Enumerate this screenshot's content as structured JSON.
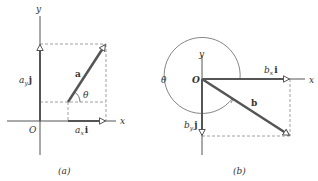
{
  "figure": {
    "panel_a": {
      "caption": "(a)",
      "x_axis_label": "x",
      "y_axis_label": "y",
      "origin_label": "O",
      "vector_label": "a",
      "angle_label": "θ",
      "x_component": {
        "coef": "a",
        "sub": "x",
        "unit": "i"
      },
      "y_component": {
        "coef": "a",
        "sub": "y",
        "unit": "j"
      }
    },
    "panel_b": {
      "caption": "(b)",
      "x_axis_label": "x",
      "y_axis_label": "y",
      "origin_label": "O",
      "vector_label": "b",
      "angle_label": "θ",
      "x_component": {
        "coef": "b",
        "sub": "x",
        "unit": "i"
      },
      "y_component": {
        "coef": "b",
        "sub": "y",
        "unit": "j"
      }
    },
    "colors": {
      "axis": "#555555",
      "vector": "#555555",
      "dashed": "#888888",
      "text": "#333333"
    }
  }
}
